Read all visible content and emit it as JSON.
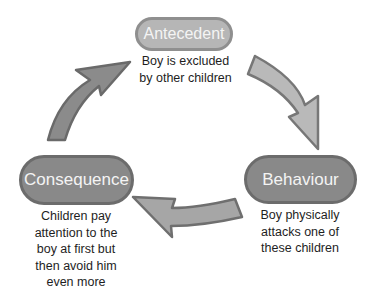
{
  "diagram": {
    "type": "cycle",
    "direction": "clockwise",
    "nodes": [
      {
        "id": "antecedent",
        "label": "Antecedent",
        "caption_lines": [
          "Boy is excluded",
          "by other children"
        ]
      },
      {
        "id": "behaviour",
        "label": "Behaviour",
        "caption_lines": [
          "Boy physically",
          "attacks one of",
          "these children"
        ]
      },
      {
        "id": "consequence",
        "label": "Consequence",
        "caption_lines": [
          "Children pay",
          "attention to the",
          "boy at first but",
          "then avoid him",
          "even more"
        ]
      }
    ],
    "edges": [
      {
        "from": "antecedent",
        "to": "behaviour"
      },
      {
        "from": "behaviour",
        "to": "consequence"
      },
      {
        "from": "consequence",
        "to": "antecedent"
      }
    ],
    "colors": {
      "light_fill": "#b6b6b6",
      "dark_fill": "#898989",
      "arrow_border": "#6f6f6f",
      "text": "#1e1e1e"
    }
  }
}
